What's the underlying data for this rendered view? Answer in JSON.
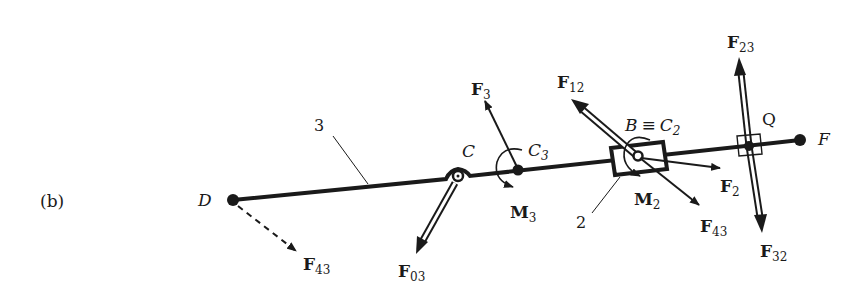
{
  "figure": {
    "panel_label": "(b)",
    "colors": {
      "ink": "#1a1a1a",
      "background": "#ffffff"
    },
    "points": {
      "D": "D",
      "C": "C",
      "C3": {
        "base": "C",
        "sub": "3"
      },
      "B": "B",
      "equiv": "≡",
      "C2": {
        "base": "C",
        "sub": "2"
      },
      "Q": "Q",
      "F": "F"
    },
    "members": {
      "link3": "3",
      "slider2": "2"
    },
    "forces": {
      "F43_D": {
        "base": "F",
        "sub": "43"
      },
      "F03": {
        "base": "F",
        "sub": "03"
      },
      "F3": {
        "base": "F",
        "sub": "3"
      },
      "F12": {
        "base": "F",
        "sub": "12"
      },
      "F2": {
        "base": "F",
        "sub": "2"
      },
      "F43_B": {
        "base": "F",
        "sub": "43"
      },
      "F23": {
        "base": "F",
        "sub": "23"
      },
      "F32": {
        "base": "F",
        "sub": "32"
      }
    },
    "moments": {
      "M3": {
        "base": "M",
        "sub": "3"
      },
      "M2": {
        "base": "M",
        "sub": "2"
      }
    }
  }
}
